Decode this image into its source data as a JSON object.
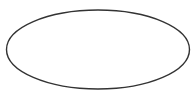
{
  "canvas": {
    "width": 196,
    "height": 97,
    "background_color": "#ffffff",
    "title": "Ellipse Outline"
  },
  "shapes": [
    {
      "name": "ellipse",
      "icon_name": "ellipse-shape",
      "type": "ellipse",
      "center_x": 98,
      "center_y": 49.5,
      "radius_x": 91.5,
      "radius_y": 39.5,
      "fill_color": "#ffffff",
      "stroke_color": "#333333",
      "stroke_width": 1.4,
      "bounds": {
        "left": 6.5,
        "top": 10,
        "right": 189.5,
        "bottom": 89
      }
    }
  ]
}
